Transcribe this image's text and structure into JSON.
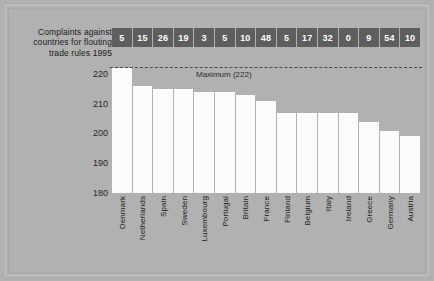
{
  "title": "Complaints against countries for  flouting trade rules 1995",
  "annotation": {
    "maximum_label": "Maximum (222)"
  },
  "colors": {
    "background": "#b1b1b1",
    "bar_fill": "#fbfbfb",
    "value_box": "#5e5e5e",
    "value_text": "#ffffff",
    "text": "#1b1b1b",
    "max_line": "#4a4a4a"
  },
  "chart_data": {
    "type": "bar",
    "title": "Complaints against countries for  flouting trade rules 1995",
    "xlabel": "",
    "ylabel": "",
    "ylim": [
      180,
      222
    ],
    "yticks": [
      180,
      190,
      200,
      210,
      220
    ],
    "ytick_labels": [
      "180",
      "190",
      "200",
      "210",
      "220"
    ],
    "grid": false,
    "legend": null,
    "categories": [
      "Denmark",
      "Netherlands",
      "Spain",
      "Sweden",
      "Luxembourg",
      "Portugal",
      "Britain",
      "France",
      "Finland",
      "Belgium",
      "Italy",
      "Ireland",
      "Greece",
      "Germany",
      "Austria"
    ],
    "values": [
      222,
      216,
      215,
      215,
      214,
      214,
      213,
      211,
      207,
      207,
      207,
      207,
      204,
      201,
      199
    ],
    "data_labels": [
      "5",
      "15",
      "26",
      "19",
      "3",
      "5",
      "10",
      "48",
      "5",
      "17",
      "32",
      "0",
      "9",
      "54",
      "10"
    ],
    "annotations": [
      {
        "text": "Maximum (222)",
        "y": 222,
        "style": "dashed-line"
      }
    ]
  }
}
